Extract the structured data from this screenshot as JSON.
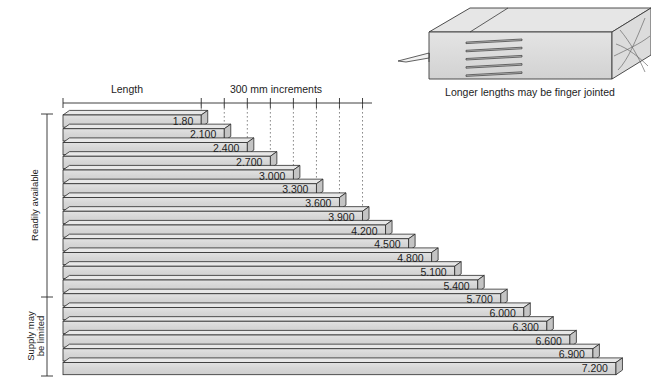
{
  "figure": {
    "title_labels": {
      "length": "Length",
      "increments": "300 mm increments"
    },
    "side_brackets": [
      {
        "label": "Readily available",
        "from_index": 0,
        "to_index": 13
      },
      {
        "label": "Supply may\nbe limited",
        "line1": "Supply may",
        "line2": "be limited",
        "from_index": 14,
        "to_index": 18
      }
    ],
    "inset": {
      "caption": "Longer lengths may be finger jointed"
    },
    "colors": {
      "bar_face": "#d9d9d9",
      "bar_top": "#e8e8e8",
      "bar_end": "#c4c4c4",
      "outline": "#2b2b2b",
      "gridline": "#6b6b6b",
      "axis": "#2b2b2b",
      "background": "#ffffff"
    }
  },
  "chart_data": {
    "type": "bar",
    "xlabel": "Length",
    "ylabel": "",
    "orientation": "horizontal",
    "unit": "metres",
    "increment_mm": 300,
    "grid": true,
    "legend": "none",
    "axis_note": "300 mm increments",
    "categories": [
      "1.80",
      "2.100",
      "2.400",
      "2.700",
      "3.000",
      "3.300",
      "3.600",
      "3.900",
      "4.200",
      "4.500",
      "4.800",
      "5.100",
      "5.400",
      "5.700",
      "6.000",
      "6.300",
      "6.600",
      "6.900",
      "7.200"
    ],
    "values": [
      1.8,
      2.1,
      2.4,
      2.7,
      3.0,
      3.3,
      3.6,
      3.9,
      4.2,
      4.5,
      4.8,
      5.1,
      5.4,
      5.7,
      6.0,
      6.3,
      6.6,
      6.9,
      7.2
    ],
    "xlim": [
      0,
      7.2
    ],
    "availability": [
      "Readily available",
      "Readily available",
      "Readily available",
      "Readily available",
      "Readily available",
      "Readily available",
      "Readily available",
      "Readily available",
      "Readily available",
      "Readily available",
      "Readily available",
      "Readily available",
      "Readily available",
      "Readily available",
      "Supply may be limited",
      "Supply may be limited",
      "Supply may be limited",
      "Supply may be limited",
      "Supply may be limited"
    ],
    "tick_values": [
      1.8,
      2.1,
      2.4,
      2.7,
      3.0,
      3.3,
      3.6,
      3.9,
      4.2
    ]
  }
}
